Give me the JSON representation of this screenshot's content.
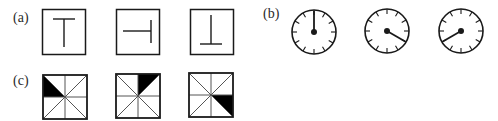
{
  "panels": {
    "a": {
      "label": "(a)",
      "figures": [
        {
          "name": "t-upright",
          "glyph": "T"
        },
        {
          "name": "t-rotated-right",
          "glyph": "⊣"
        },
        {
          "name": "t-inverted",
          "glyph": "⊥"
        }
      ]
    },
    "b": {
      "label": "(b)",
      "clocks": [
        {
          "name": "clock-12",
          "hand_angle_deg": 0
        },
        {
          "name": "clock-4",
          "hand_angle_deg": 120
        },
        {
          "name": "clock-8",
          "hand_angle_deg": 240
        }
      ],
      "tick_count": 12
    },
    "c": {
      "label": "(c)",
      "figures": [
        {
          "name": "shaded-top-left",
          "shaded_region": "top-left quadrant, lower half"
        },
        {
          "name": "shaded-top-right",
          "shaded_region": "top-right quadrant, left half"
        },
        {
          "name": "shaded-bottom-right",
          "shaded_region": "bottom-right quadrant, upper half"
        }
      ]
    }
  },
  "colors": {
    "stroke": "#1a1a1a",
    "fill": "#000000",
    "background": "#ffffff",
    "thin_line": "#555555"
  }
}
